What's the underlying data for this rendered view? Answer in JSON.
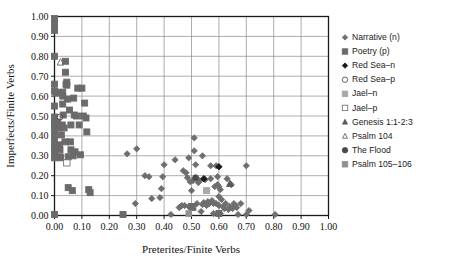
{
  "chart_data": {
    "type": "scatter",
    "title": "",
    "xlabel": "Preterites/Finite Verbs",
    "ylabel": "Imperfects/Finite Verbs",
    "xlim": [
      0.0,
      1.0
    ],
    "ylim": [
      0.0,
      1.0
    ],
    "xticks": [
      "0.00",
      "0.10",
      "0.20",
      "0.30",
      "0.40",
      "0.50",
      "0.60",
      "0.70",
      "0.80",
      "0.90",
      "1.00"
    ],
    "yticks": [
      "0.00",
      "0.10",
      "0.20",
      "0.30",
      "0.40",
      "0.50",
      "0.60",
      "0.70",
      "0.80",
      "0.90",
      "1.00"
    ],
    "grid": true,
    "legend_position": "right",
    "series": [
      {
        "name": "Narrative (n)",
        "marker": "diamond",
        "color": "#6e6e6e",
        "filled": true,
        "size": 3.1,
        "points": [
          [
            0.295,
            0.06
          ],
          [
            0.355,
            0.085
          ],
          [
            0.385,
            0.09
          ],
          [
            0.39,
            0.135
          ],
          [
            0.395,
            0.195
          ],
          [
            0.4,
            0.255
          ],
          [
            0.425,
            0.005
          ],
          [
            0.44,
            0.28
          ],
          [
            0.455,
            0.04
          ],
          [
            0.46,
            0.045
          ],
          [
            0.465,
            0.05
          ],
          [
            0.47,
            0.225
          ],
          [
            0.475,
            0.05
          ],
          [
            0.48,
            0.215
          ],
          [
            0.485,
            0.19
          ],
          [
            0.49,
            0.045
          ],
          [
            0.495,
            0.17
          ],
          [
            0.5,
            0.125
          ],
          [
            0.5,
            0.045
          ],
          [
            0.505,
            0.175
          ],
          [
            0.51,
            0.39
          ],
          [
            0.515,
            0.255
          ],
          [
            0.52,
            0.06
          ],
          [
            0.525,
            0.165
          ],
          [
            0.53,
            0.175
          ],
          [
            0.535,
            0.02
          ],
          [
            0.54,
            0.3
          ],
          [
            0.54,
            0.055
          ],
          [
            0.545,
            0.065
          ],
          [
            0.55,
            0.18
          ],
          [
            0.555,
            0.125
          ],
          [
            0.555,
            0.05
          ],
          [
            0.56,
            0.07
          ],
          [
            0.565,
            0.06
          ],
          [
            0.57,
            0.25
          ],
          [
            0.57,
            0.185
          ],
          [
            0.575,
            0.075
          ],
          [
            0.58,
            0.06
          ],
          [
            0.58,
            0.01
          ],
          [
            0.585,
            0.145
          ],
          [
            0.59,
            0.25
          ],
          [
            0.59,
            0.06
          ],
          [
            0.595,
            0.155
          ],
          [
            0.595,
            0.195
          ],
          [
            0.6,
            0.145
          ],
          [
            0.6,
            0.095
          ],
          [
            0.6,
            0.05
          ],
          [
            0.605,
            0.13
          ],
          [
            0.605,
            0.01
          ],
          [
            0.61,
            0.08
          ],
          [
            0.615,
            0.045
          ],
          [
            0.62,
            0.035
          ],
          [
            0.625,
            0.06
          ],
          [
            0.63,
            0.185
          ],
          [
            0.635,
            0.03
          ],
          [
            0.64,
            0.045
          ],
          [
            0.645,
            0.155
          ],
          [
            0.65,
            0.035
          ],
          [
            0.655,
            0.06
          ],
          [
            0.66,
            0.05
          ],
          [
            0.665,
            0.04
          ],
          [
            0.67,
            0.005
          ],
          [
            0.68,
            0.06
          ],
          [
            0.7,
            0.25
          ],
          [
            0.7,
            0.005
          ],
          [
            0.71,
            0.025
          ],
          [
            0.805,
            0.005
          ],
          [
            0.33,
            0.2
          ],
          [
            0.345,
            0.195
          ],
          [
            0.3,
            0.335
          ],
          [
            0.265,
            0.31
          ],
          [
            0.25,
            0.005
          ],
          [
            0.51,
            0.325
          ],
          [
            0.49,
            0.29
          ]
        ]
      },
      {
        "name": "Poetry (p)",
        "marker": "square",
        "color": "#6a6a6a",
        "filled": true,
        "size": 3.0,
        "points": [
          [
            0.0,
            0.99
          ],
          [
            0.0,
            0.96
          ],
          [
            0.0,
            0.93
          ],
          [
            0.0,
            0.8
          ],
          [
            0.0,
            0.66
          ],
          [
            0.0,
            0.625
          ],
          [
            0.0,
            0.55
          ],
          [
            0.0,
            0.495
          ],
          [
            0.0,
            0.465
          ],
          [
            0.0,
            0.455
          ],
          [
            0.0,
            0.43
          ],
          [
            0.0,
            0.4
          ],
          [
            0.0,
            0.37
          ],
          [
            0.0,
            0.34
          ],
          [
            0.0,
            0.32
          ],
          [
            0.0,
            0.3
          ],
          [
            0.0,
            0.29
          ],
          [
            0.0,
            0.005
          ],
          [
            0.005,
            0.62
          ],
          [
            0.01,
            0.615
          ],
          [
            0.012,
            0.47
          ],
          [
            0.015,
            0.44
          ],
          [
            0.018,
            0.355
          ],
          [
            0.02,
            0.33
          ],
          [
            0.02,
            0.295
          ],
          [
            0.022,
            0.29
          ],
          [
            0.025,
            0.405
          ],
          [
            0.028,
            0.455
          ],
          [
            0.03,
            0.6
          ],
          [
            0.03,
            0.56
          ],
          [
            0.032,
            0.505
          ],
          [
            0.035,
            0.44
          ],
          [
            0.038,
            0.37
          ],
          [
            0.04,
            0.775
          ],
          [
            0.04,
            0.72
          ],
          [
            0.042,
            0.66
          ],
          [
            0.045,
            0.67
          ],
          [
            0.045,
            0.655
          ],
          [
            0.048,
            0.585
          ],
          [
            0.05,
            0.295
          ],
          [
            0.05,
            0.14
          ],
          [
            0.055,
            0.53
          ],
          [
            0.058,
            0.37
          ],
          [
            0.06,
            0.455
          ],
          [
            0.06,
            0.33
          ],
          [
            0.065,
            0.125
          ],
          [
            0.068,
            0.3
          ],
          [
            0.07,
            0.59
          ],
          [
            0.072,
            0.505
          ],
          [
            0.075,
            0.32
          ],
          [
            0.08,
            0.5
          ],
          [
            0.085,
            0.64
          ],
          [
            0.09,
            0.455
          ],
          [
            0.095,
            0.305
          ],
          [
            0.1,
            0.64
          ],
          [
            0.105,
            0.5
          ],
          [
            0.11,
            0.565
          ],
          [
            0.115,
            0.49
          ],
          [
            0.118,
            0.42
          ],
          [
            0.125,
            0.13
          ],
          [
            0.13,
            0.115
          ],
          [
            0.25,
            0.005
          ],
          [
            0.5,
            0.045
          ],
          [
            0.505,
            0.04
          ],
          [
            0.6,
            0.01
          ],
          [
            0.03,
            0.62
          ]
        ]
      },
      {
        "name": "Red Sea–n",
        "marker": "diamond",
        "color": "#1a1a1a",
        "filled": true,
        "size": 3.2,
        "points": [
          [
            0.545,
            0.185
          ],
          [
            0.6,
            0.245
          ]
        ]
      },
      {
        "name": "Red Sea–p",
        "marker": "circle-open",
        "color": "#555555",
        "filled": false,
        "size": 3.0,
        "points": [
          [
            0.02,
            0.495
          ]
        ]
      },
      {
        "name": "Jael–n",
        "marker": "square",
        "color": "#a8a8a8",
        "filled": true,
        "size": 3.0,
        "points": [
          [
            0.555,
            0.125
          ]
        ]
      },
      {
        "name": "Jael–p",
        "marker": "square-open",
        "color": "#777777",
        "filled": false,
        "size": 3.2,
        "points": [
          [
            0.045,
            0.265
          ]
        ]
      },
      {
        "name": "Genesis 1:1-2:3",
        "marker": "triangle",
        "color": "#5a5a5a",
        "filled": true,
        "size": 3.6,
        "points": [
          [
            0.64,
            0.16
          ]
        ]
      },
      {
        "name": "Psalm 104",
        "marker": "triangle-open",
        "color": "#666666",
        "filled": false,
        "size": 3.6,
        "points": [
          [
            0.022,
            0.77
          ]
        ]
      },
      {
        "name": "The Flood",
        "marker": "circle",
        "color": "#4a4a4a",
        "filled": true,
        "size": 2.9,
        "points": [
          [
            0.515,
            0.19
          ]
        ]
      },
      {
        "name": "Psalm 105–106",
        "marker": "square",
        "color": "#909090",
        "filled": true,
        "size": 2.8,
        "points": [
          [
            0.49,
            0.01
          ]
        ]
      }
    ]
  },
  "legend": {
    "entries": [
      "Narrative (n)",
      "Poetry (p)",
      "Red Sea–n",
      "Red Sea–p",
      "Jael–n",
      "Jael–p",
      "Genesis 1:1-2:3",
      "Psalm 104",
      "The Flood",
      "Psalm 105–106"
    ]
  },
  "colors": {
    "frame": "#1a1a1a",
    "grid": "#8a8a8a",
    "narrative": "#6e6e6e",
    "poetry": "#6a6a6a",
    "background": "#ffffff"
  }
}
